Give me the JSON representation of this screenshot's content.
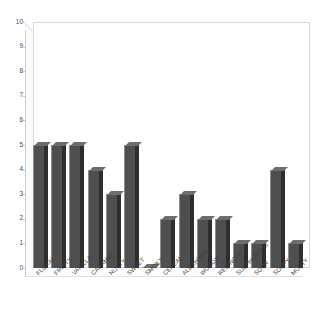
{
  "chart_data": {
    "type": "bar",
    "title": "",
    "subtitle": "",
    "xlabel": "",
    "ylabel": "",
    "ylim": [
      0,
      10
    ],
    "yticks": [
      0,
      1,
      2,
      3,
      4,
      5,
      6,
      7,
      8,
      9,
      10
    ],
    "ytick_labels": [
      "0",
      "1",
      "2",
      "3",
      "4",
      "5",
      "6",
      "7",
      "8",
      "9",
      "10"
    ],
    "grid": false,
    "legend": null,
    "style": "3d-column",
    "bar_color": "#4f4f4f",
    "bar_side_color": "#2e2e2e",
    "bar_top_color": "#6d6d6d",
    "wall_color": "#d8d8d8",
    "background": "#ffffff",
    "categories": [
      "FLORAL",
      "FRUITY",
      "VANILLA",
      "CARAMEL",
      "NUTTY",
      "SWEET",
      "SMOKY",
      "CEREAL",
      "ALDEHYDIC",
      "WOODY",
      "RESINOUS",
      "SULPHUROUS",
      "SOUR",
      "SOAPY",
      "MUSTY"
    ],
    "values": [
      5,
      5,
      5,
      4,
      3,
      5,
      0,
      2,
      3,
      2,
      2,
      1,
      1,
      4,
      1
    ]
  }
}
